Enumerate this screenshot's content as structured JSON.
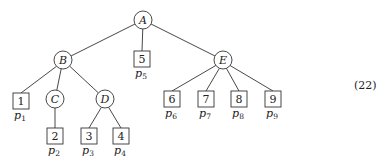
{
  "diagram": {
    "type": "tree",
    "equation_number": "(22)",
    "internal_nodes": [
      {
        "id": "A",
        "label": "A",
        "cx": 143,
        "cy": 20
      },
      {
        "id": "B",
        "label": "B",
        "cx": 63,
        "cy": 60
      },
      {
        "id": "C",
        "label": "C",
        "cx": 55,
        "cy": 99
      },
      {
        "id": "D",
        "label": "D",
        "cx": 105,
        "cy": 99
      },
      {
        "id": "E",
        "label": "E",
        "cx": 223,
        "cy": 60
      }
    ],
    "leaves": [
      {
        "id": "1",
        "label": "1",
        "p": "p",
        "sub": "1",
        "x": 13,
        "y": 93
      },
      {
        "id": "2",
        "label": "2",
        "p": "p",
        "sub": "2",
        "x": 47,
        "y": 128
      },
      {
        "id": "3",
        "label": "3",
        "p": "p",
        "sub": "3",
        "x": 81,
        "y": 128
      },
      {
        "id": "4",
        "label": "4",
        "p": "p",
        "sub": "4",
        "x": 113,
        "y": 128
      },
      {
        "id": "5",
        "label": "5",
        "p": "p",
        "sub": "5",
        "x": 134,
        "y": 51
      },
      {
        "id": "6",
        "label": "6",
        "p": "p",
        "sub": "6",
        "x": 164,
        "y": 91
      },
      {
        "id": "7",
        "label": "7",
        "p": "p",
        "sub": "7",
        "x": 198,
        "y": 91
      },
      {
        "id": "8",
        "label": "8",
        "p": "p",
        "sub": "8",
        "x": 231,
        "y": 91
      },
      {
        "id": "9",
        "label": "9",
        "p": "p",
        "sub": "9",
        "x": 265,
        "y": 91
      }
    ],
    "edges": [
      [
        "A",
        "B"
      ],
      [
        "A",
        "5"
      ],
      [
        "A",
        "E"
      ],
      [
        "B",
        "1"
      ],
      [
        "B",
        "C"
      ],
      [
        "B",
        "D"
      ],
      [
        "C",
        "2"
      ],
      [
        "D",
        "3"
      ],
      [
        "D",
        "4"
      ],
      [
        "E",
        "6"
      ],
      [
        "E",
        "7"
      ],
      [
        "E",
        "8"
      ],
      [
        "E",
        "9"
      ]
    ]
  }
}
